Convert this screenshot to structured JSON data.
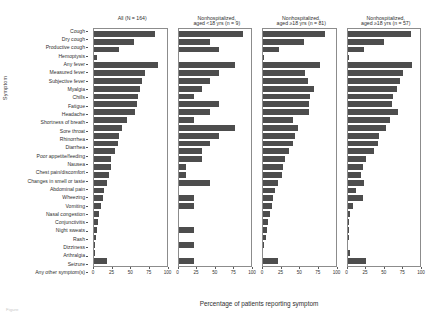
{
  "chart_data": {
    "type": "bar",
    "orientation": "horizontal",
    "title": "",
    "xlabel": "Percentage of patients reporting symptom",
    "ylabel": "Symptom",
    "xlim": [
      0,
      100
    ],
    "xticks": [
      0,
      25,
      50,
      75,
      100
    ],
    "xticklabels": [
      "0",
      "25",
      "50",
      "75",
      "100"
    ],
    "grid": false,
    "legend": "none",
    "bar_color": "#4d4d4d",
    "categories": [
      "Cough",
      "Dry cough",
      "Productive cough",
      "Hemoptysis",
      "Any fever",
      "Measured fever",
      "Subjective fever",
      "Myalgia",
      "Chills",
      "Fatigue",
      "Headache",
      "Shortness of breath",
      "Sore throat",
      "Rhinorrhea",
      "Diarrhea",
      "Poor appetite/feeding",
      "Nausea",
      "Chest pain/discomfort",
      "Changes in smell or taste",
      "Abdominal pain",
      "Wheezing",
      "Vomiting",
      "Nasal congestion",
      "Conjunctivitis",
      "Night sweats",
      "Rash",
      "Dizziness",
      "Arthralgia",
      "Seizure",
      "Any other symptom(s)"
    ],
    "panels": [
      {
        "id": "all",
        "title": "All (N = 164)",
        "title_line1": "All (N = 164)",
        "title_line2": "",
        "n": 164,
        "values": [
          84,
          55,
          35,
          4,
          88,
          70,
          66,
          64,
          61,
          59,
          57,
          46,
          39,
          34,
          33,
          29,
          24,
          23,
          21,
          18,
          14,
          12,
          10,
          7,
          5,
          4,
          3,
          2,
          1,
          18
        ]
      },
      {
        "id": "nonhosp-under18",
        "title": "Nonhospitalized, aged <18 yrs (n = 9)",
        "title_line1": "Nonhospitalized,",
        "title_line2": "aged <18 yrs (n = 9)",
        "n": 9,
        "values": [
          89,
          44,
          56,
          0,
          78,
          56,
          44,
          33,
          22,
          56,
          44,
          22,
          78,
          56,
          44,
          33,
          33,
          11,
          11,
          44,
          0,
          22,
          22,
          0,
          0,
          22,
          0,
          22,
          0,
          22
        ]
      },
      {
        "id": "nonhosp-18plus-81",
        "title": "Nonhospitalized, aged ≥18 yrs (n = 81)",
        "title_line1": "Nonhospitalized,",
        "title_line2": "aged ≥18 yrs (n = 81)",
        "n": 81,
        "values": [
          86,
          56,
          22,
          2,
          78,
          58,
          62,
          70,
          65,
          64,
          63,
          42,
          48,
          44,
          42,
          36,
          31,
          27,
          26,
          21,
          16,
          14,
          12,
          9,
          7,
          5,
          4,
          2,
          0,
          20
        ]
      },
      {
        "id": "nonhosp-18plus-57",
        "title": "Nonhospitalized, aged ≥18 yrs (n = 57)",
        "title_line1": "Nonhospitalized,",
        "title_line2": "aged ≥18 yrs (n = 57)",
        "n": 57,
        "values": [
          88,
          51,
          23,
          2,
          89,
          77,
          72,
          68,
          63,
          61,
          70,
          58,
          53,
          44,
          42,
          37,
          26,
          21,
          19,
          23,
          12,
          21,
          7,
          4,
          2,
          2,
          2,
          0,
          4,
          25
        ]
      }
    ]
  },
  "footnote": {
    "text": "Figure"
  }
}
